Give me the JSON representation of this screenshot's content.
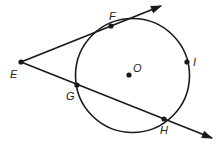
{
  "diagram": {
    "type": "geometry",
    "colors": {
      "stroke": "#1a1a1a",
      "background": "#ffffff"
    },
    "circle": {
      "center_label": "O",
      "cx": 132.5,
      "cy": 75.5,
      "r": 57
    },
    "points": {
      "E": {
        "label": "E",
        "x": 21,
        "y": 62
      },
      "F": {
        "label": "F",
        "x": 111,
        "y": 26
      },
      "G": {
        "label": "G",
        "x": 77,
        "y": 85
      },
      "H": {
        "label": "H",
        "x": 164,
        "y": 119
      },
      "I": {
        "label": "I",
        "x": 187,
        "y": 62
      },
      "O": {
        "label": "O",
        "x": 129,
        "y": 75
      }
    },
    "rays": [
      {
        "name": "tangent-ray-EF",
        "from": "E",
        "through": "F",
        "tip": [
          161,
          6
        ]
      },
      {
        "name": "secant-ray-EH",
        "from": "E",
        "through": [
          "G",
          "H"
        ],
        "tip": [
          212,
          138
        ]
      }
    ]
  }
}
